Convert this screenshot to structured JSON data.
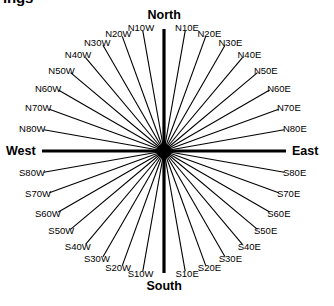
{
  "page": {
    "clipped_heading": "ings",
    "background_color": "#ffffff",
    "line_color": "#000000"
  },
  "compass": {
    "center": {
      "x": 164,
      "y": 151
    },
    "radius": 122,
    "cardinals": [
      {
        "name": "north",
        "label": "North",
        "bearing_deg": 0
      },
      {
        "name": "east",
        "label": "East",
        "bearing_deg": 90
      },
      {
        "name": "south",
        "label": "South",
        "bearing_deg": 180
      },
      {
        "name": "west",
        "label": "West",
        "bearing_deg": 270
      }
    ],
    "quadrant_labels": [
      {
        "label": "N10W",
        "bearing_deg": 350
      },
      {
        "label": "N20W",
        "bearing_deg": 340
      },
      {
        "label": "N30W",
        "bearing_deg": 330
      },
      {
        "label": "N40W",
        "bearing_deg": 320
      },
      {
        "label": "N50W",
        "bearing_deg": 310
      },
      {
        "label": "N60W",
        "bearing_deg": 300
      },
      {
        "label": "N70W",
        "bearing_deg": 290
      },
      {
        "label": "N80W",
        "bearing_deg": 280
      },
      {
        "label": "N10E",
        "bearing_deg": 10
      },
      {
        "label": "N20E",
        "bearing_deg": 20
      },
      {
        "label": "N30E",
        "bearing_deg": 30
      },
      {
        "label": "N40E",
        "bearing_deg": 40
      },
      {
        "label": "N50E",
        "bearing_deg": 50
      },
      {
        "label": "N60E",
        "bearing_deg": 60
      },
      {
        "label": "N70E",
        "bearing_deg": 70
      },
      {
        "label": "N80E",
        "bearing_deg": 80
      },
      {
        "label": "S80E",
        "bearing_deg": 100
      },
      {
        "label": "S70E",
        "bearing_deg": 110
      },
      {
        "label": "S60E",
        "bearing_deg": 120
      },
      {
        "label": "S50E",
        "bearing_deg": 130
      },
      {
        "label": "S40E",
        "bearing_deg": 140
      },
      {
        "label": "S30E",
        "bearing_deg": 150
      },
      {
        "label": "S20E",
        "bearing_deg": 160
      },
      {
        "label": "S10E",
        "bearing_deg": 170
      },
      {
        "label": "S10W",
        "bearing_deg": 190
      },
      {
        "label": "S20W",
        "bearing_deg": 200
      },
      {
        "label": "S30W",
        "bearing_deg": 210
      },
      {
        "label": "S40W",
        "bearing_deg": 220
      },
      {
        "label": "S50W",
        "bearing_deg": 230
      },
      {
        "label": "S60W",
        "bearing_deg": 240
      },
      {
        "label": "S70W",
        "bearing_deg": 250
      },
      {
        "label": "S80W",
        "bearing_deg": 260
      }
    ]
  },
  "chart_data": {
    "type": "scatter",
    "xlabel": "",
    "ylabel": "",
    "categories": [
      "North",
      "N10E",
      "N20E",
      "N30E",
      "N40E",
      "N50E",
      "N60E",
      "N70E",
      "N80E",
      "East",
      "S80E",
      "S70E",
      "S60E",
      "S50E",
      "S40E",
      "S30E",
      "S20E",
      "S10E",
      "South",
      "S10W",
      "S20W",
      "S30W",
      "S40W",
      "S50W",
      "S60W",
      "S70W",
      "S80W",
      "West",
      "N80W",
      "N70W",
      "N60W",
      "N50W",
      "N40W",
      "N30W",
      "N20W",
      "N10W"
    ],
    "values": [
      0,
      10,
      20,
      30,
      40,
      50,
      60,
      70,
      80,
      90,
      100,
      110,
      120,
      130,
      140,
      150,
      160,
      170,
      180,
      190,
      200,
      210,
      220,
      230,
      240,
      250,
      260,
      270,
      280,
      290,
      300,
      310,
      320,
      330,
      340,
      350
    ],
    "ylim": [
      0,
      360
    ],
    "grid": false,
    "legend": "none"
  }
}
